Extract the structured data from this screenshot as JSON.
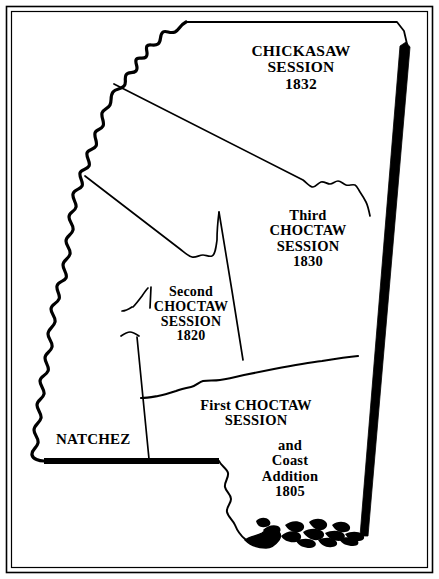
{
  "figure": {
    "kind": "historical-map",
    "frame_color": "#000000",
    "background_color": "#ffffff",
    "ink_color": "#000000",
    "width": 439,
    "height": 579
  },
  "labels": {
    "chickasaw": {
      "name": "chickasaw-cession",
      "lines": [
        "CHICKASAW",
        "SESSION",
        "1832"
      ],
      "year": "1832"
    },
    "third_choctaw": {
      "name": "third-choctaw-cession",
      "lines": [
        "Third",
        "CHOCTAW",
        "SESSION",
        "1830"
      ],
      "year": "1830"
    },
    "second_choctaw": {
      "name": "second-choctaw-cession",
      "lines": [
        "Second",
        "CHOCTAW",
        "SESSION",
        "1820"
      ],
      "year": "1820"
    },
    "first_choctaw": {
      "name": "first-choctaw-cession",
      "lines": [
        "First CHOCTAW",
        "SESSION"
      ],
      "year": "1805"
    },
    "coast_addition": {
      "name": "coast-addition",
      "lines": [
        "and",
        "Coast",
        "Addition",
        "1805"
      ],
      "year": "1805"
    },
    "natchez": {
      "name": "natchez-district",
      "lines": [
        "NATCHEZ"
      ]
    }
  },
  "regions": [
    {
      "id": "chickasaw-session-1832",
      "label": "CHICKASAW SESSION 1832",
      "year": "1832"
    },
    {
      "id": "third-choctaw-session-1830",
      "label": "Third CHOCTAW SESSION 1830",
      "year": "1830"
    },
    {
      "id": "second-choctaw-session-1820",
      "label": "Second CHOCTAW SESSION 1820",
      "year": "1820"
    },
    {
      "id": "first-choctaw-session-1805",
      "label": "First CHOCTAW SESSION and Coast Addition 1805",
      "year": "1805"
    },
    {
      "id": "natchez-district",
      "label": "NATCHEZ"
    }
  ],
  "boundaries": {
    "west": "Mississippi River (meandering)",
    "east": "Alabama state line (heavy rule)",
    "south": "31st parallel (heavy rule) and Gulf Coast",
    "north": "Tennessee state line (thin rule)"
  }
}
